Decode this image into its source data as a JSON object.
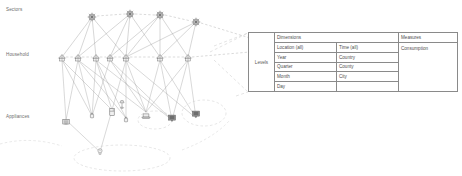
{
  "diagram": {
    "tiers": [
      {
        "id": "sectors",
        "label": "Sectors"
      },
      {
        "id": "household",
        "label": "Household"
      },
      {
        "id": "appliances",
        "label": "Appliances"
      }
    ],
    "node_counts": {
      "sectors": 4,
      "households": 7,
      "appliances": 9
    },
    "colors": {
      "node_stroke": "#6f6f6f",
      "edge_solid": "#9a9a9a",
      "edge_dashed": "#b4b4b4",
      "projection": "#c9c9c9",
      "table_border": "#8a8a8a",
      "text": "#4f4f4f"
    }
  },
  "cube": {
    "levels_label": "Levels",
    "dimensions_header": "Dimensions",
    "measures_header": "Measures",
    "measures": [
      "Consumption"
    ],
    "hierarchies": [
      {
        "name": "Location",
        "levels": [
          "Location (all)",
          "Year",
          "Quarter",
          "Month",
          "Day"
        ]
      },
      {
        "name": "Time",
        "levels": [
          "Time (all)",
          "Country",
          "County",
          "City",
          ""
        ]
      }
    ]
  }
}
